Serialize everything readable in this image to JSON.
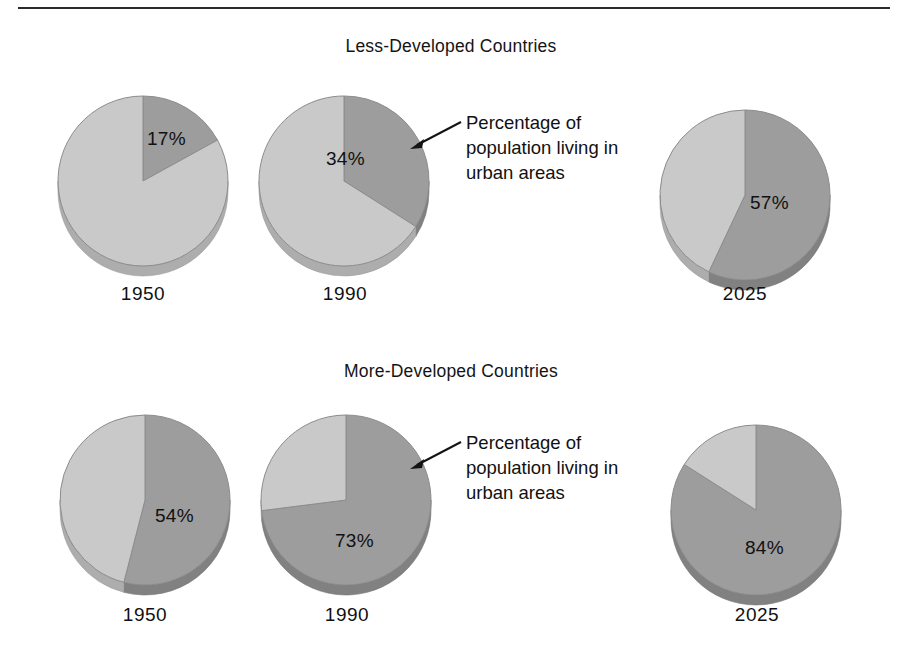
{
  "figure": {
    "background_color": "#ffffff",
    "rule_color": "#2b2b2b",
    "urban_color": "#9d9d9d",
    "rural_color": "#c9c9c9",
    "edge_color": "#8c8c8c",
    "shadow_color": "#a8a8a8"
  },
  "panels": [
    {
      "title": "Less-Developed Countries",
      "callout": {
        "line1": "Percentage of",
        "line2": "population living in",
        "line3": "urban areas"
      },
      "pies": [
        {
          "year": "1950",
          "pct_label": "17%",
          "urban": 17,
          "rural": 83
        },
        {
          "year": "1990",
          "pct_label": "34%",
          "urban": 34,
          "rural": 66
        },
        {
          "year": "2025",
          "pct_label": "57%",
          "urban": 57,
          "rural": 43
        }
      ]
    },
    {
      "title": "More-Developed Countries",
      "callout": {
        "line1": "Percentage of",
        "line2": "population living in",
        "line3": "urban areas"
      },
      "pies": [
        {
          "year": "1950",
          "pct_label": "54%",
          "urban": 54,
          "rural": 46
        },
        {
          "year": "1990",
          "pct_label": "73%",
          "urban": 73,
          "rural": 27
        },
        {
          "year": "2025",
          "pct_label": "84%",
          "urban": 84,
          "rural": 16
        }
      ]
    }
  ],
  "chart_data": {
    "type": "pie",
    "title": "Percentage of population living in urban areas",
    "xlabel": "",
    "ylabel": "",
    "legend_position": "none",
    "grid": false,
    "annotations": [
      "Percentage of population living in urban areas",
      "Percentage of population living in urban areas"
    ],
    "panels": [
      {
        "name": "Less-Developed Countries",
        "categories": [
          "1950",
          "1990",
          "2025"
        ],
        "series": [
          {
            "name": "Urban",
            "values": [
              17,
              34,
              57
            ]
          },
          {
            "name": "Rural",
            "values": [
              83,
              66,
              43
            ]
          }
        ],
        "slices": [
          {
            "category": "1950",
            "labels": [
              "Urban",
              "Rural"
            ],
            "values": [
              17,
              83
            ],
            "data_label": "17%"
          },
          {
            "category": "1990",
            "labels": [
              "Urban",
              "Rural"
            ],
            "values": [
              34,
              66
            ],
            "data_label": "34%"
          },
          {
            "category": "2025",
            "labels": [
              "Urban",
              "Rural"
            ],
            "values": [
              57,
              43
            ],
            "data_label": "57%"
          }
        ]
      },
      {
        "name": "More-Developed Countries",
        "categories": [
          "1950",
          "1990",
          "2025"
        ],
        "series": [
          {
            "name": "Urban",
            "values": [
              54,
              73,
              84
            ]
          },
          {
            "name": "Rural",
            "values": [
              46,
              27,
              16
            ]
          }
        ],
        "slices": [
          {
            "category": "1950",
            "labels": [
              "Urban",
              "Rural"
            ],
            "values": [
              54,
              46
            ],
            "data_label": "54%"
          },
          {
            "category": "1990",
            "labels": [
              "Urban",
              "Rural"
            ],
            "values": [
              73,
              27
            ],
            "data_label": "73%"
          },
          {
            "category": "2025",
            "labels": [
              "Urban",
              "Rural"
            ],
            "values": [
              84,
              16
            ],
            "data_label": "84%"
          }
        ]
      }
    ],
    "units": "percent",
    "ylim": [
      0,
      100
    ]
  }
}
